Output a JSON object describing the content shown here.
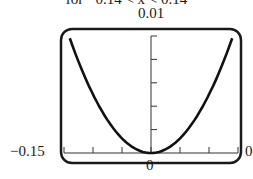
{
  "caption": "for  −0.14 < x < 0.14",
  "chart_data": {
    "type": "line",
    "title": "",
    "function": "y = x^2 (parabola)",
    "xlabel": "",
    "ylabel": "",
    "xlim": [
      -0.15,
      0.15
    ],
    "ylim": [
      0,
      0.01
    ],
    "tick_labels": {
      "y_top": "0.01",
      "x_left": "−0.15",
      "x_right": "0.15",
      "origin": "0"
    },
    "x_ticks": 6,
    "y_ticks": 5,
    "series": [
      {
        "name": "curve",
        "x": [
          -0.14,
          -0.1,
          -0.05,
          0,
          0.05,
          0.1,
          0.14
        ],
        "y": [
          0.0096,
          0.0049,
          0.0012,
          0,
          0.0012,
          0.0049,
          0.0096
        ]
      }
    ],
    "grid": false,
    "legend": null
  },
  "labels": {
    "ymax": "0.01",
    "xmin": "−0.15",
    "xmax": "0",
    "origin": "0"
  }
}
